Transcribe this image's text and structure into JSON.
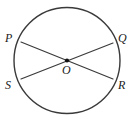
{
  "figure": {
    "type": "circle-with-two-intersecting-chords",
    "stroke_color": "#3a3a3a",
    "fill_color": "#ffffff",
    "background_color": "#ffffff",
    "center_dot_color": "#111111",
    "circle": {
      "cx": 67,
      "cy": 60.5,
      "r": 53,
      "stroke_width": 1.4
    },
    "center_point": {
      "label": "O",
      "x": 67,
      "y": 60.5,
      "dot_radius": 2.1
    },
    "points": [
      {
        "label": "P",
        "x": 21,
        "y": 42
      },
      {
        "label": "Q",
        "x": 113,
        "y": 43
      },
      {
        "label": "S",
        "x": 21,
        "y": 79
      },
      {
        "label": "R",
        "x": 113,
        "y": 79
      }
    ],
    "chords": [
      {
        "name": "chord-P-R",
        "from": "P",
        "to": "R",
        "x1": 21,
        "y1": 42,
        "x2": 113,
        "y2": 79
      },
      {
        "name": "chord-S-Q",
        "from": "S",
        "to": "Q",
        "x1": 21,
        "y1": 79,
        "x2": 113,
        "y2": 43
      }
    ],
    "labels": {
      "P": "P",
      "Q": "Q",
      "S": "S",
      "R": "R",
      "O": "O"
    }
  }
}
